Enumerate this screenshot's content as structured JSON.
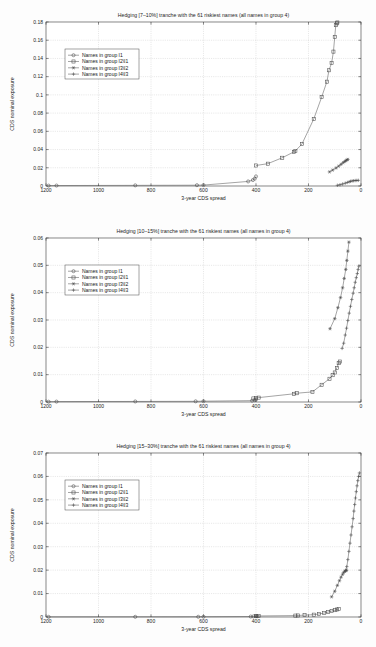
{
  "figure": {
    "shared_xlabel": "3-year CDS spread",
    "shared_ylabel": "CDS nominal exposure",
    "legend_labels": [
      "Names in group I1",
      "Names in group I2\\I1",
      "Names in group I3\\I2",
      "Names in group I4\\I3"
    ],
    "marker_names": [
      "circle-marker",
      "square-marker",
      "asterisk-marker",
      "plus-marker"
    ]
  },
  "chart_data": [
    {
      "type": "line",
      "title": "Hedging [7–10%] tranche with the 61 riskiest names (all names in group 4)",
      "xlabel": "3-year CDS spread",
      "ylabel": "CDS nominal exposure",
      "xlim": [
        1200,
        0
      ],
      "ylim": [
        0,
        0.18
      ],
      "xticks": [
        1200,
        1000,
        800,
        600,
        400,
        200,
        0
      ],
      "yticks": [
        0,
        0.02,
        0.04,
        0.06,
        0.08,
        0.1,
        0.12,
        0.14,
        0.16,
        0.18
      ],
      "grid": true,
      "legend_position": "upper-left",
      "series": [
        {
          "name": "Names in group I1",
          "marker": "circle",
          "x": [
            1190,
            1160,
            860,
            625,
            600,
            430,
            412,
            405,
            400
          ],
          "y": [
            0.0004,
            0.0005,
            0.0007,
            0.0009,
            0.001,
            0.005,
            0.0065,
            0.008,
            0.0105
          ]
        },
        {
          "name": "Names in group I2\\I1",
          "marker": "square",
          "x": [
            400,
            355,
            300,
            255,
            250,
            225,
            180,
            150,
            130,
            122,
            112,
            105,
            100,
            96,
            92,
            90
          ],
          "y": [
            0.0225,
            0.0245,
            0.031,
            0.0375,
            0.0385,
            0.046,
            0.0735,
            0.0975,
            0.1145,
            0.127,
            0.135,
            0.1475,
            0.1635,
            0.1765,
            0.1785,
            0.1795
          ]
        },
        {
          "name": "Names in group I3\\I2",
          "marker": "asterisk",
          "x": [
            120,
            108,
            95,
            85,
            76,
            68,
            62,
            58,
            54,
            50
          ],
          "y": [
            0.0155,
            0.0175,
            0.0198,
            0.0218,
            0.0238,
            0.0256,
            0.0268,
            0.0278,
            0.0286,
            0.0292
          ]
        },
        {
          "name": "Names in group I4\\I3",
          "marker": "plus",
          "x": [
            90,
            80,
            70,
            60,
            52,
            45,
            40,
            34,
            28,
            22,
            16,
            10
          ],
          "y": [
            0.0008,
            0.0014,
            0.0022,
            0.0031,
            0.0039,
            0.0046,
            0.0051,
            0.0055,
            0.0058,
            0.006,
            0.0061,
            0.0062
          ]
        }
      ]
    },
    {
      "type": "line",
      "title": "Hedging [10–15%] tranche with the 61 riskiest names (all names in group 4)",
      "xlabel": "3-year CDS spread",
      "ylabel": "CDS nominal exposure",
      "xlim": [
        1200,
        0
      ],
      "ylim": [
        0,
        0.06
      ],
      "xticks": [
        1200,
        1000,
        800,
        600,
        400,
        200,
        0
      ],
      "yticks": [
        0,
        0.01,
        0.02,
        0.03,
        0.04,
        0.05,
        0.06
      ],
      "grid": true,
      "legend_position": "upper-left",
      "series": [
        {
          "name": "Names in group I1",
          "marker": "circle",
          "x": [
            1190,
            1160,
            860,
            630,
            600,
            415,
            405,
            400
          ],
          "y": [
            0.0001,
            0.00015,
            0.0002,
            0.00025,
            0.0003,
            0.0005,
            0.0007,
            0.0009
          ]
        },
        {
          "name": "Names in group I2\\I1",
          "marker": "square",
          "x": [
            410,
            400,
            390,
            255,
            245,
            185,
            150,
            120,
            108,
            100,
            92,
            85,
            80
          ],
          "y": [
            0.0013,
            0.0015,
            0.0016,
            0.003,
            0.0032,
            0.0037,
            0.0063,
            0.0085,
            0.0098,
            0.0108,
            0.0125,
            0.0142,
            0.0148
          ]
        },
        {
          "name": "Names in group I3\\I2",
          "marker": "asterisk",
          "x": [
            118,
            100,
            88,
            78,
            70,
            64,
            58,
            54,
            50,
            46
          ],
          "y": [
            0.0268,
            0.0305,
            0.0345,
            0.0382,
            0.0418,
            0.0452,
            0.0485,
            0.0518,
            0.0552,
            0.0585
          ]
        },
        {
          "name": "Names in group I4\\I3",
          "marker": "plus",
          "x": [
            72,
            66,
            60,
            55,
            50,
            45,
            40,
            35,
            30,
            26,
            22,
            18,
            14,
            11,
            8
          ],
          "y": [
            0.0196,
            0.0215,
            0.0245,
            0.027,
            0.0298,
            0.0325,
            0.035,
            0.0375,
            0.0398,
            0.0418,
            0.0438,
            0.0455,
            0.047,
            0.0485,
            0.0497
          ]
        }
      ]
    },
    {
      "type": "line",
      "title": "Hedging [15–30%] tranche with the 61 riskiest names (all names in group 4)",
      "xlabel": "3-year CDS spread",
      "ylabel": "CDS nominal exposure",
      "xlim": [
        1200,
        0
      ],
      "ylim": [
        0,
        0.07
      ],
      "xticks": [
        1200,
        1000,
        800,
        600,
        400,
        200,
        0
      ],
      "yticks": [
        0,
        0.01,
        0.02,
        0.03,
        0.04,
        0.05,
        0.06,
        0.07
      ],
      "grid": true,
      "legend_position": "upper-left",
      "series": [
        {
          "name": "Names in group I1",
          "marker": "circle",
          "x": [
            1190,
            860,
            620,
            600,
            420,
            410,
            400,
            395
          ],
          "y": [
            5e-05,
            8e-05,
            0.0001,
            0.00012,
            0.0002,
            0.00025,
            0.0003,
            0.00035
          ]
        },
        {
          "name": "Names in group I2\\I1",
          "marker": "square",
          "x": [
            400,
            390,
            250,
            240,
            215,
            180,
            160,
            140,
            125,
            112,
            100,
            92,
            85
          ],
          "y": [
            0.0004,
            0.00045,
            0.0006,
            0.00065,
            0.0008,
            0.001,
            0.0013,
            0.0017,
            0.0021,
            0.0025,
            0.0029,
            0.0032,
            0.0034
          ]
        },
        {
          "name": "Names in group I3\\I2",
          "marker": "asterisk",
          "x": [
            112,
            100,
            90,
            82,
            76,
            70,
            66,
            62,
            58,
            55
          ],
          "y": [
            0.0086,
            0.011,
            0.0135,
            0.0155,
            0.017,
            0.0182,
            0.019,
            0.0195,
            0.0198,
            0.02
          ]
        },
        {
          "name": "Names in group I4\\I3",
          "marker": "plus",
          "x": [
            58,
            54,
            50,
            46,
            42,
            38,
            34,
            30,
            27,
            24,
            21,
            18,
            15,
            12,
            9,
            6
          ],
          "y": [
            0.0198,
            0.0215,
            0.0245,
            0.028,
            0.0315,
            0.035,
            0.0385,
            0.042,
            0.0452,
            0.048,
            0.0508,
            0.0535,
            0.056,
            0.0582,
            0.06,
            0.0615
          ]
        }
      ]
    }
  ]
}
